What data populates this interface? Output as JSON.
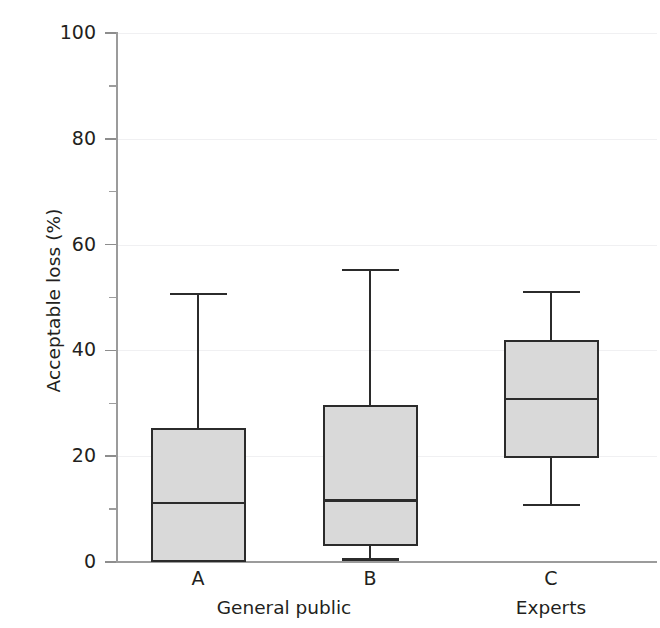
{
  "chart_data": {
    "type": "box",
    "title": "",
    "xlabel": "",
    "ylabel": "Acceptable loss (%)",
    "ylim": [
      0,
      100
    ],
    "yticks": [
      0,
      20,
      40,
      60,
      80,
      100
    ],
    "ytick_labels": [
      "0",
      "20",
      "40",
      "60",
      "80",
      "100"
    ],
    "yminor_ticks": [
      10,
      30,
      50,
      70,
      90
    ],
    "grid": true,
    "legend": "none",
    "categories": [
      "A",
      "B",
      "C"
    ],
    "group_labels": [
      "General public",
      "Experts"
    ],
    "group_spans": [
      [
        "A",
        "B"
      ],
      [
        "C"
      ]
    ],
    "box_fill_color": "#d9d9d9",
    "box_edge_color": "#2b2b2b",
    "axis_color": "#9b9b9b",
    "grid_color": "#f0f0f2",
    "boxes": [
      {
        "label": "A",
        "whisker_low": 0.0,
        "q1": 0.0,
        "median": 11.2,
        "q3": 25.4,
        "whisker_high": 50.6
      },
      {
        "label": "B",
        "whisker_low": 0.5,
        "q1": 3.0,
        "median": 11.6,
        "q3": 29.6,
        "whisker_high": 55.3
      },
      {
        "label": "C",
        "whisker_low": 10.8,
        "q1": 19.6,
        "median": 30.8,
        "q3": 42.0,
        "whisker_high": 51.1
      }
    ]
  }
}
